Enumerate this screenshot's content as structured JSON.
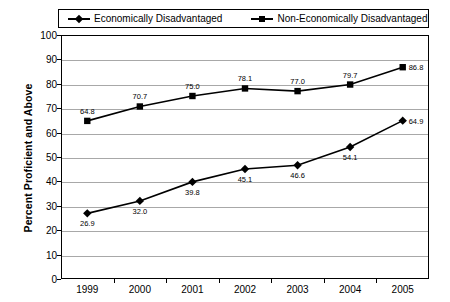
{
  "chart_data": {
    "type": "line",
    "title": "",
    "xlabel": "",
    "ylabel": "Percent Proficient and Above",
    "categories": [
      "1999",
      "2000",
      "2001",
      "2002",
      "2003",
      "2004",
      "2005"
    ],
    "ylim": [
      0,
      100
    ],
    "ytick_step": 10,
    "yticks": [
      "0",
      "10",
      "20",
      "30",
      "40",
      "50",
      "60",
      "70",
      "80",
      "90",
      "100"
    ],
    "grid": true,
    "legend_position": "top",
    "series": [
      {
        "name": "Economically Disadvantaged",
        "marker": "diamond",
        "color": "#000000",
        "values": [
          26.9,
          32.0,
          39.8,
          45.1,
          46.6,
          54.1,
          64.9
        ],
        "labels": [
          "26.9",
          "32.0",
          "39.8",
          "45.1",
          "46.6",
          "54.1",
          "64.9"
        ]
      },
      {
        "name": "Non-Economically Disadvantaged",
        "marker": "square",
        "color": "#000000",
        "values": [
          64.8,
          70.7,
          75.0,
          78.1,
          77.0,
          79.7,
          86.8
        ],
        "labels": [
          "64.8",
          "70.7",
          "75.0",
          "78.1",
          "77.0",
          "79.7",
          "86.8"
        ]
      }
    ]
  },
  "legend": {
    "entries": [
      {
        "label": "Economically Disadvantaged",
        "marker": "diamond"
      },
      {
        "label": "Non-Economically Disadvantaged",
        "marker": "square"
      }
    ]
  },
  "axes": {
    "y_title": "Percent Proficient and Above"
  },
  "colors": {
    "line": "#000000",
    "grid": "#a8a8a8",
    "frame": "#000000",
    "background": "#ffffff"
  }
}
